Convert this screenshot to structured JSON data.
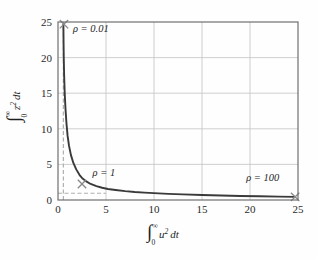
{
  "figure": {
    "background_color": "#fefefe",
    "frame_color": "#6f6f6f",
    "grid_color": "#c9c9c9",
    "curve_color": "#3a3a3a",
    "dashed_color": "#b0b0b0",
    "marker_color": "#8a8a8a"
  },
  "chart_data": {
    "type": "line",
    "title": "",
    "xlabel": "∫₀^∞ u² dt",
    "ylabel": "∫₀^∞ z² dt",
    "xlabel_parts": {
      "integral": "∫",
      "lower": "0",
      "upper": "∞",
      "variable": "u",
      "power": "2",
      "differential": "dt"
    },
    "ylabel_parts": {
      "integral": "∫",
      "lower": "0",
      "upper": "∞",
      "variable": "z",
      "power": "2",
      "differential": "dt"
    },
    "xlim": [
      0,
      25
    ],
    "ylim": [
      0,
      25
    ],
    "xticks": [
      0,
      5,
      10,
      15,
      20,
      25
    ],
    "yticks": [
      0,
      5,
      10,
      15,
      20,
      25
    ],
    "xticklabels": [
      "0",
      "5",
      "10",
      "15",
      "20",
      "25"
    ],
    "yticklabels": [
      "0",
      "5",
      "10",
      "15",
      "20",
      "25"
    ],
    "grid": true,
    "legend": "none",
    "series": [
      {
        "name": "pareto-tradeoff-curve",
        "x": [
          0.56,
          0.58,
          0.6,
          0.64,
          0.7,
          0.78,
          0.88,
          1.0,
          1.15,
          1.35,
          1.6,
          1.9,
          2.25,
          2.5,
          2.9,
          3.4,
          4.0,
          4.6,
          5.2,
          6.0,
          7.0,
          8.0,
          9.0,
          10.0,
          11.5,
          13.0,
          15.0,
          17.0,
          19.0,
          21.0,
          23.0,
          24.7
        ],
        "y": [
          24.7,
          22.0,
          20.0,
          17.5,
          15.0,
          12.8,
          10.8,
          9.0,
          7.6,
          6.3,
          5.2,
          4.3,
          3.5,
          3.1,
          2.65,
          2.25,
          1.95,
          1.72,
          1.55,
          1.4,
          1.24,
          1.12,
          1.03,
          0.96,
          0.86,
          0.79,
          0.7,
          0.63,
          0.57,
          0.52,
          0.47,
          0.44
        ]
      }
    ],
    "asymptotes": [
      {
        "name": "vertical-asymptote",
        "type": "vertical",
        "value": 0.56,
        "style": "dashed",
        "from": 0,
        "to": 25
      },
      {
        "name": "horizontal-asymptote",
        "type": "horizontal",
        "value": 0.95,
        "style": "dashed",
        "from": 0,
        "to": 5.0
      }
    ],
    "markers": [
      {
        "name": "rho-0.01-marker",
        "x": 0.62,
        "y": 24.7,
        "symbol": "x"
      },
      {
        "name": "rho-1-marker",
        "x": 2.5,
        "y": 2.25,
        "symbol": "x"
      },
      {
        "name": "rho-100-marker",
        "x": 24.7,
        "y": 0.44,
        "symbol": "x"
      }
    ],
    "annotations": [
      {
        "name": "rho-0.01-label",
        "text": "ρ = 0.01",
        "x": 1.55,
        "y": 23.6
      },
      {
        "name": "rho-1-label",
        "text": "ρ = 1",
        "x": 3.6,
        "y": 3.35
      },
      {
        "name": "rho-100-label",
        "text": "ρ = 100",
        "x": 19.6,
        "y": 2.6
      }
    ]
  },
  "annotation_symbols": {
    "rho": "ρ",
    "equals": "=",
    "rho_001_value": "0.01",
    "rho_1_value": "1",
    "rho_100_value": "100"
  }
}
